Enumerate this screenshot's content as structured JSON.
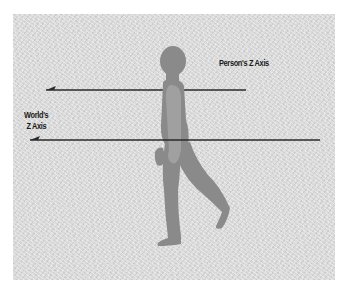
{
  "diagram": {
    "labels": {
      "person_axis": "Person's Z Axis",
      "world_axis_line1": "World's",
      "world_axis_line2": "Z Axis"
    },
    "colors": {
      "background": "#d9d9d9",
      "figure": "#8a8a8a",
      "figure_arm": "#a0a0a0",
      "axis_line": "#2a2a2a",
      "text": "#1a1a1a"
    },
    "axes": [
      {
        "name": "person-z-axis",
        "x1": 45,
        "x2": 246,
        "y": 90,
        "direction": "left"
      },
      {
        "name": "world-z-axis",
        "x1": 30,
        "x2": 320,
        "y": 140,
        "direction": "left"
      }
    ]
  }
}
